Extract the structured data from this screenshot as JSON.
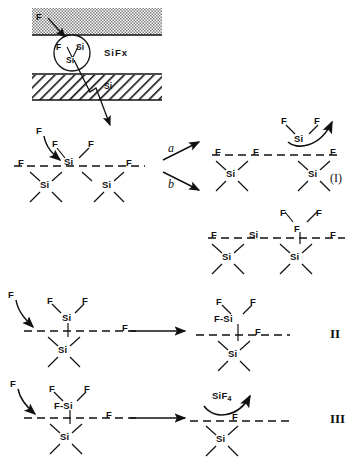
{
  "figure": {
    "type": "reaction-mechanism-diagram",
    "ink_color": "#111111",
    "background_color": "#ffffff"
  },
  "top_inset": {
    "incoming_atom": "F",
    "gas_region_label": "",
    "circle_atoms": [
      "F",
      "Si",
      "Si"
    ],
    "product_label": "SiFx",
    "bulk_label": "Si"
  },
  "scheme_I": {
    "numeral": "(I)",
    "branch_a_label": "a",
    "branch_b_label": "b",
    "reactant": {
      "incoming_atom": "F",
      "surface_atoms": [
        "F",
        "F",
        "Si",
        "F",
        "F"
      ],
      "sub_surface_atoms": [
        "Si",
        "Si"
      ]
    },
    "product_a": {
      "leaving_group_atoms": [
        "F",
        "F",
        "Si"
      ],
      "surface_atoms": [
        "F",
        "F",
        "F"
      ],
      "sub_surface_atoms": [
        "Si",
        "Si"
      ]
    },
    "product_b": {
      "surface_atoms": [
        "F",
        "F",
        "F",
        "Si",
        "F",
        "F"
      ],
      "sub_surface_atoms": [
        "Si",
        "Si"
      ]
    }
  },
  "scheme_II": {
    "numeral": "II",
    "reactant": {
      "incoming_atom": "F",
      "top_atoms": [
        "F",
        "Si",
        "F"
      ],
      "surface_atoms": [
        "F"
      ],
      "sub_surface_atoms": [
        "Si"
      ]
    },
    "product": {
      "top_atoms": [
        "F",
        "F",
        "F-Si"
      ],
      "surface_atoms": [
        "F"
      ],
      "sub_surface_atoms": [
        "Si"
      ]
    }
  },
  "scheme_III": {
    "numeral": "III",
    "reactant": {
      "incoming_atom": "F",
      "top_atoms": [
        "F",
        "F-Si",
        "F"
      ],
      "surface_atoms": [
        "F"
      ],
      "sub_surface_atoms": [
        "Si"
      ]
    },
    "product": {
      "desorbing_molecule": "SiF",
      "desorbing_molecule_subscript": "4",
      "surface_atoms": [
        "F"
      ],
      "sub_surface_atoms": [
        "Si"
      ]
    }
  }
}
